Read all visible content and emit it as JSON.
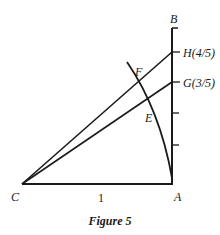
{
  "figure": {
    "caption": "Figure 5",
    "points": {
      "A": "A",
      "B": "B",
      "C": "C",
      "E": "E",
      "F": "F",
      "G": "G(3/5)",
      "H": "H(4/5)"
    },
    "segment_label_CA": "1",
    "colors": {
      "ink": "#1a1a1a",
      "background": "#ffffff"
    }
  }
}
